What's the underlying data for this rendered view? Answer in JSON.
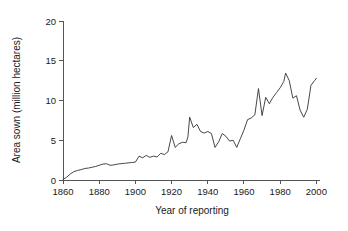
{
  "chart_data": {
    "type": "line",
    "title": "",
    "xlabel": "Year of reporting",
    "ylabel": "Area sown (million hectares)",
    "xlim": [
      1860,
      2002
    ],
    "ylim": [
      0,
      20
    ],
    "xticks": [
      1860,
      1880,
      1900,
      1920,
      1940,
      1960,
      1980,
      2000
    ],
    "xtick_labels": [
      "1860",
      "1880",
      "1900",
      "1920",
      "1940",
      "1960",
      "1980",
      "2000"
    ],
    "yticks": [
      0,
      5,
      10,
      15,
      20
    ],
    "ytick_labels": [
      "0",
      "5",
      "10",
      "15",
      "20"
    ],
    "grid": false,
    "legend": false,
    "line_color": "#333333",
    "axis_color": "#555555",
    "series": [
      {
        "name": "Area sown",
        "x": [
          1860,
          1862,
          1864,
          1866,
          1868,
          1870,
          1872,
          1874,
          1876,
          1878,
          1880,
          1882,
          1884,
          1886,
          1888,
          1890,
          1892,
          1894,
          1896,
          1898,
          1900,
          1902,
          1904,
          1906,
          1908,
          1910,
          1912,
          1914,
          1916,
          1918,
          1920,
          1922,
          1924,
          1926,
          1928,
          1929,
          1930,
          1932,
          1934,
          1936,
          1938,
          1940,
          1942,
          1944,
          1946,
          1948,
          1950,
          1952,
          1954,
          1956,
          1958,
          1960,
          1962,
          1964,
          1966,
          1968,
          1970,
          1972,
          1974,
          1976,
          1978,
          1980,
          1982,
          1983,
          1985,
          1987,
          1989,
          1991,
          1993,
          1995,
          1997,
          1999,
          2000
        ],
        "values": [
          0.05,
          0.35,
          0.75,
          1.05,
          1.2,
          1.3,
          1.45,
          1.5,
          1.6,
          1.7,
          1.85,
          2.0,
          2.05,
          1.85,
          1.9,
          2.0,
          2.05,
          2.1,
          2.15,
          2.2,
          2.25,
          3.0,
          2.8,
          3.1,
          2.85,
          3.0,
          2.9,
          3.35,
          3.2,
          3.55,
          5.6,
          4.1,
          4.55,
          4.75,
          4.7,
          5.4,
          7.9,
          6.6,
          7.0,
          6.1,
          5.9,
          6.1,
          5.85,
          4.1,
          4.8,
          5.85,
          5.5,
          4.9,
          5.0,
          4.1,
          5.2,
          6.3,
          7.6,
          7.8,
          8.2,
          11.5,
          8.1,
          10.4,
          9.6,
          10.4,
          11.0,
          11.6,
          12.4,
          13.45,
          12.5,
          10.3,
          10.6,
          8.8,
          7.9,
          8.9,
          11.9,
          12.5,
          12.8
        ],
        "units": "million hectares"
      }
    ]
  },
  "axes": {
    "y_title": "Area sown (million hectares)",
    "x_title": "Year of reporting"
  }
}
